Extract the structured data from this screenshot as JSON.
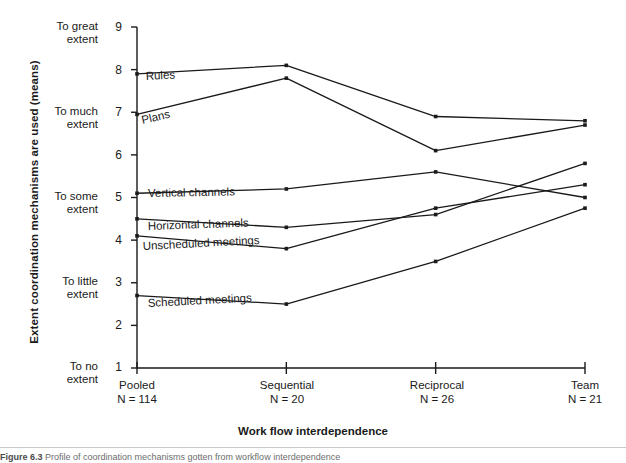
{
  "figure": {
    "axis_title_y": "Extent coordination mechanisms are used (means)",
    "axis_title_x": "Work flow interdependence",
    "caption_number": "Figure 6.3",
    "caption_text": "Profile of coordination mechanisms gotten from workflow interdependence"
  },
  "axes": {
    "y_numeric_ticks": [
      "9",
      "8",
      "7",
      "6",
      "5",
      "4",
      "3",
      "2",
      "1"
    ],
    "y_category_labels": [
      {
        "value": 9,
        "line1": "To great",
        "line2": "extent"
      },
      {
        "value": 7,
        "line1": "To much",
        "line2": "extent"
      },
      {
        "value": 5,
        "line1": "To some",
        "line2": "extent"
      },
      {
        "value": 3,
        "line1": "To little",
        "line2": "extent"
      },
      {
        "value": 1,
        "line1": "To no",
        "line2": "extent"
      }
    ],
    "x_ticks": [
      {
        "label": "Pooled",
        "n": "N = 114"
      },
      {
        "label": "Sequential",
        "n": "N = 20"
      },
      {
        "label": "Reciprocal",
        "n": "N = 26"
      },
      {
        "label": "Team",
        "n": "N = 21"
      }
    ]
  },
  "chart_data": {
    "type": "line",
    "title": "",
    "xlabel": "Work flow interdependence",
    "ylabel": "Extent coordination mechanisms are used (means)",
    "categories": [
      "Pooled",
      "Sequential",
      "Reciprocal",
      "Team"
    ],
    "category_n": [
      "N = 114",
      "N = 20",
      "N = 26",
      "N = 21"
    ],
    "ylim": [
      1,
      9
    ],
    "yticks": [
      1,
      2,
      3,
      4,
      5,
      6,
      7,
      8,
      9
    ],
    "ytick_verbal": {
      "9": "To great extent",
      "7": "To much extent",
      "5": "To some extent",
      "3": "To little extent",
      "1": "To no extent"
    },
    "grid": false,
    "legend": "inline-labels",
    "line_color": "#1a1a1a",
    "marker": "square",
    "series": [
      {
        "name": "Rules",
        "values": [
          7.9,
          8.1,
          6.9,
          6.8
        ]
      },
      {
        "name": "Plans",
        "values": [
          6.95,
          7.8,
          6.1,
          6.7
        ]
      },
      {
        "name": "Vertical channels",
        "values": [
          5.1,
          5.2,
          5.6,
          5.0
        ]
      },
      {
        "name": "Horizontal channels",
        "values": [
          4.5,
          4.3,
          4.6,
          5.8
        ]
      },
      {
        "name": "Unscheduled meetings",
        "values": [
          4.1,
          3.8,
          4.75,
          5.3
        ]
      },
      {
        "name": "Scheduled meetings",
        "values": [
          2.7,
          2.5,
          3.5,
          4.75
        ]
      }
    ],
    "series_label_positions": [
      {
        "name": "Rules",
        "x": 146,
        "y": 70,
        "rotate": -3
      },
      {
        "name": "Plans",
        "x": 143,
        "y": 114,
        "rotate": -13
      },
      {
        "name": "Vertical channels",
        "x": 148,
        "y": 187,
        "rotate": -1
      },
      {
        "name": "Horizontal channels",
        "x": 148,
        "y": 220,
        "rotate": -2
      },
      {
        "name": "Unscheduled meetings",
        "x": 143,
        "y": 240,
        "rotate": -3
      },
      {
        "name": "Scheduled meetings",
        "x": 148,
        "y": 297,
        "rotate": -3
      }
    ]
  }
}
